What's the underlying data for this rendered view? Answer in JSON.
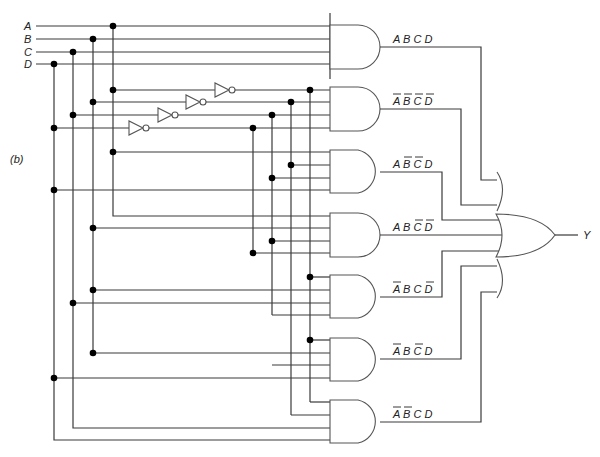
{
  "figure": {
    "panel_label": "(b)",
    "output_label": "Y",
    "inputs": [
      {
        "name": "A",
        "y": 26,
        "bus_x": 113
      },
      {
        "name": "B",
        "y": 39,
        "bus_x": 93
      },
      {
        "name": "C",
        "y": 52,
        "bus_x": 73
      },
      {
        "name": "D",
        "y": 64,
        "bus_x": 54
      }
    ],
    "inverters": [
      {
        "input": "A",
        "y": 90,
        "x": 215,
        "comp_bus_x": 310
      },
      {
        "input": "B",
        "y": 102,
        "x": 186,
        "comp_bus_x": 291
      },
      {
        "input": "C",
        "y": 115,
        "x": 158,
        "comp_bus_x": 272
      },
      {
        "input": "D",
        "y": 128,
        "x": 129,
        "comp_bus_x": 253
      }
    ],
    "and_gates": [
      {
        "id": "g1",
        "terms": [
          {
            "v": "A",
            "neg": false
          },
          {
            "v": "B",
            "neg": false
          },
          {
            "v": "C",
            "neg": false
          },
          {
            "v": "D",
            "neg": false
          }
        ],
        "text": "ABCD"
      },
      {
        "id": "g2",
        "terms": [
          {
            "v": "A",
            "neg": true
          },
          {
            "v": "B",
            "neg": true
          },
          {
            "v": "C",
            "neg": true
          },
          {
            "v": "D",
            "neg": true
          }
        ],
        "text": "A̅B̅C̅D̅"
      },
      {
        "id": "g3",
        "terms": [
          {
            "v": "A",
            "neg": false
          },
          {
            "v": "B",
            "neg": true
          },
          {
            "v": "C",
            "neg": true
          },
          {
            "v": "D",
            "neg": false
          }
        ],
        "text": "AB̅C̅D"
      },
      {
        "id": "g4",
        "terms": [
          {
            "v": "A",
            "neg": false
          },
          {
            "v": "B",
            "neg": false
          },
          {
            "v": "C",
            "neg": true
          },
          {
            "v": "D",
            "neg": true
          }
        ],
        "text": "ABC̅D̅"
      },
      {
        "id": "g5",
        "terms": [
          {
            "v": "A",
            "neg": true
          },
          {
            "v": "B",
            "neg": false
          },
          {
            "v": "C",
            "neg": false
          },
          {
            "v": "D",
            "neg": true
          }
        ],
        "text": "A̅BCD̅"
      },
      {
        "id": "g6",
        "terms": [
          {
            "v": "A",
            "neg": true
          },
          {
            "v": "B",
            "neg": false
          },
          {
            "v": "C",
            "neg": true
          },
          {
            "v": "D",
            "neg": false
          }
        ],
        "text": "A̅BC̅D"
      },
      {
        "id": "g7",
        "terms": [
          {
            "v": "A",
            "neg": true
          },
          {
            "v": "B",
            "neg": true
          },
          {
            "v": "C",
            "neg": false
          },
          {
            "v": "D",
            "neg": false
          }
        ],
        "text": "A̅B̅CD"
      }
    ],
    "or_gate": {
      "inputs": 7,
      "output": "Y"
    },
    "colors": {
      "wire": "#3a3a3a",
      "gate_stroke": "#555555",
      "dot": "#000000",
      "background": "#ffffff"
    }
  }
}
